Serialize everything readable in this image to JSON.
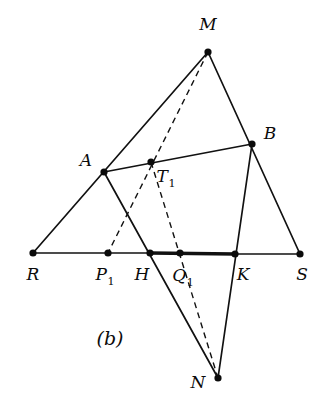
{
  "figure": {
    "caption": "(b)",
    "caption_position": {
      "x": 110,
      "y": 345
    },
    "background_color": "#ffffff",
    "ink_color": "#111111",
    "width": 322,
    "height": 403
  },
  "chart_data": {
    "type": "diagram",
    "title": "(b)",
    "subtype": "plane-geometry-construction",
    "xlabel": "",
    "ylabel": "",
    "xlim": [
      0,
      322
    ],
    "ylim": [
      403,
      0
    ],
    "grid": false,
    "legend": "none",
    "points": [
      {
        "id": "M",
        "label": "M",
        "x": 208,
        "y": 52,
        "label_x": 208,
        "label_y": 30,
        "sub": "",
        "dot": true
      },
      {
        "id": "B",
        "label": "B",
        "x": 252,
        "y": 144,
        "label_x": 270,
        "label_y": 139,
        "sub": "",
        "dot": true
      },
      {
        "id": "A",
        "label": "A",
        "x": 104,
        "y": 172,
        "label_x": 86,
        "label_y": 166,
        "sub": "",
        "dot": true
      },
      {
        "id": "T1",
        "label": "T",
        "x": 151,
        "y": 162,
        "label_x": 166,
        "label_y": 182,
        "sub": "1",
        "dot": true
      },
      {
        "id": "R",
        "label": "R",
        "x": 33,
        "y": 253,
        "label_x": 33,
        "label_y": 280,
        "sub": "",
        "dot": true
      },
      {
        "id": "P1",
        "label": "P",
        "x": 108,
        "y": 253,
        "label_x": 105,
        "label_y": 280,
        "sub": "1",
        "dot": true
      },
      {
        "id": "H",
        "label": "H",
        "x": 150,
        "y": 253,
        "label_x": 142,
        "label_y": 280,
        "sub": "",
        "dot": true
      },
      {
        "id": "Q1",
        "label": "Q",
        "x": 180,
        "y": 253,
        "label_x": 183,
        "label_y": 281,
        "sub": "1",
        "dot": true
      },
      {
        "id": "K",
        "label": "K",
        "x": 235,
        "y": 254,
        "label_x": 243,
        "label_y": 280,
        "sub": "",
        "dot": true
      },
      {
        "id": "S",
        "label": "S",
        "x": 300,
        "y": 254,
        "label_x": 302,
        "label_y": 280,
        "sub": "",
        "dot": true
      },
      {
        "id": "N",
        "label": "N",
        "x": 218,
        "y": 378,
        "label_x": 198,
        "label_y": 388,
        "sub": "",
        "dot": true
      }
    ],
    "segments": [
      {
        "id": "R-M",
        "from": "R",
        "to": "M",
        "style": "solid",
        "note": "left side of large triangle RMS"
      },
      {
        "id": "M-S",
        "from": "M",
        "to": "S",
        "style": "solid",
        "note": "right side of large triangle RMS"
      },
      {
        "id": "R-H",
        "from": "R",
        "to": "H",
        "style": "solid",
        "note": "base segment R to H"
      },
      {
        "id": "H-K",
        "from": "H",
        "to": "K",
        "style": "bold",
        "note": "emphasised base segment HK"
      },
      {
        "id": "K-S",
        "from": "K",
        "to": "S",
        "style": "solid",
        "note": "base segment K to S"
      },
      {
        "id": "A-B",
        "from": "A",
        "to": "B",
        "style": "solid",
        "note": "segment AB through T1"
      },
      {
        "id": "A-N",
        "from": "A",
        "to": "N",
        "style": "solid",
        "note": "line from A through H down to N"
      },
      {
        "id": "B-N",
        "from": "B",
        "to": "N",
        "style": "solid",
        "note": "line from B through K down to N"
      },
      {
        "id": "M-P1",
        "from": "M",
        "to": "P1",
        "style": "dashed",
        "note": "dashed cevian M through T1 to P1"
      },
      {
        "id": "T1-N",
        "from": "T1",
        "to": "N",
        "style": "dashed",
        "note": "dashed line T1 through Q1 to N"
      }
    ],
    "annotations": [
      {
        "text": "(b)",
        "x": 110,
        "y": 345,
        "role": "figure-caption"
      }
    ]
  }
}
